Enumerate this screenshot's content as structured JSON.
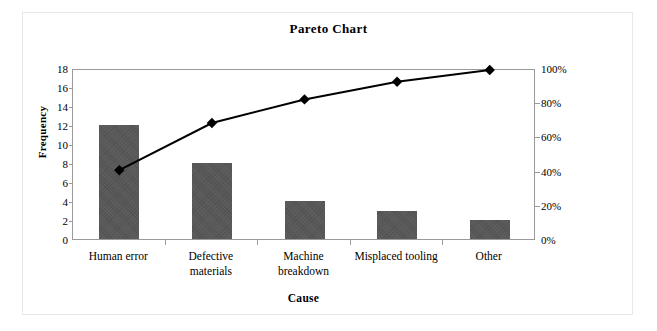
{
  "chart_data": {
    "type": "bar",
    "title": "Pareto Chart",
    "xlabel": "Cause",
    "ylabel": "Frequency",
    "y2label": "",
    "categories": [
      "Human error",
      "Defective materials",
      "Machine breakdown",
      "Misplaced tooling",
      "Other"
    ],
    "category_lines": [
      [
        "Human error"
      ],
      [
        "Defective",
        "materials"
      ],
      [
        "Machine",
        "breakdown"
      ],
      [
        "Misplaced tooling"
      ],
      [
        "Other"
      ]
    ],
    "values": [
      12,
      8,
      4,
      3,
      2
    ],
    "series": [
      {
        "name": "Frequency",
        "type": "bar",
        "axis": "left",
        "values": [
          12,
          8,
          4,
          3,
          2
        ]
      },
      {
        "name": "Cumulative %",
        "type": "line",
        "axis": "right",
        "values": [
          41.4,
          69.0,
          82.8,
          93.1,
          100.0
        ]
      }
    ],
    "ylim": [
      0,
      18
    ],
    "y2lim": [
      0,
      100
    ],
    "yticks": [
      0,
      2,
      4,
      6,
      8,
      10,
      12,
      14,
      16,
      18
    ],
    "ytick_labels": [
      "0",
      "2",
      "4",
      "6",
      "8",
      "10",
      "12",
      "14",
      "16",
      "18"
    ],
    "y2ticks": [
      0,
      20,
      40,
      60,
      80,
      100
    ],
    "y2tick_labels": [
      "0%",
      "20%",
      "40%",
      "60%",
      "80%",
      "100%"
    ],
    "grid": false,
    "legend": false,
    "legend_position": "none",
    "bar_color": "#565656",
    "line_color": "#000000",
    "marker": "diamond",
    "total": 29
  }
}
